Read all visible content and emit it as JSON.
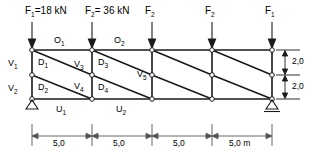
{
  "diagram": {
    "unit_note": "m",
    "colors": {
      "line": "#1a1a1a",
      "dim": "#555555",
      "node_fill": "#ffffff"
    }
  },
  "forces": [
    {
      "id": "F1-left",
      "label": "F",
      "sub": "1",
      "text": "=18 kN",
      "full": "F₁=18 kN",
      "x": 32
    },
    {
      "id": "F2-mid1",
      "label": "F",
      "sub": "2",
      "text": "= 36 kN",
      "full": "F₂= 36 kN",
      "x": 92
    },
    {
      "id": "F2-mid2",
      "label": "F",
      "sub": "2",
      "text": "",
      "full": "F₂",
      "x": 152
    },
    {
      "id": "F2-mid3",
      "label": "F",
      "sub": "2",
      "text": "",
      "full": "F₂",
      "x": 212
    },
    {
      "id": "F1-right",
      "label": "F",
      "sub": "1",
      "text": "",
      "full": "F₁",
      "x": 272
    }
  ],
  "members": {
    "top_chord": [
      {
        "label": "O",
        "sub": "1",
        "full": "O₁"
      },
      {
        "label": "O",
        "sub": "2",
        "full": "O₂"
      }
    ],
    "bottom_chord": [
      {
        "label": "U",
        "sub": "1",
        "full": "U₁"
      },
      {
        "label": "U",
        "sub": "2",
        "full": "U₂"
      }
    ],
    "verticals": [
      {
        "label": "V",
        "sub": "1",
        "full": "V₁"
      },
      {
        "label": "V",
        "sub": "2",
        "full": "V₂"
      },
      {
        "label": "V",
        "sub": "3",
        "full": "V₃"
      },
      {
        "label": "V",
        "sub": "4",
        "full": "V₄"
      },
      {
        "label": "V",
        "sub": "5",
        "full": "V₅"
      }
    ],
    "diagonals": [
      {
        "label": "D",
        "sub": "1",
        "full": "D₁"
      },
      {
        "label": "D",
        "sub": "2",
        "full": "D₂"
      },
      {
        "label": "D",
        "sub": "3",
        "full": "D₃"
      },
      {
        "label": "D",
        "sub": "4",
        "full": "D₄"
      }
    ]
  },
  "dimensions": {
    "horizontal": [
      {
        "value": "5,0"
      },
      {
        "value": "5,0"
      },
      {
        "value": "5,0"
      },
      {
        "value": "5,0 m"
      }
    ],
    "vertical": [
      {
        "value": "2,0"
      },
      {
        "value": "2,0"
      }
    ]
  },
  "supports": [
    {
      "type": "pinned-support",
      "position": "left"
    },
    {
      "type": "roller-support",
      "position": "right"
    }
  ]
}
